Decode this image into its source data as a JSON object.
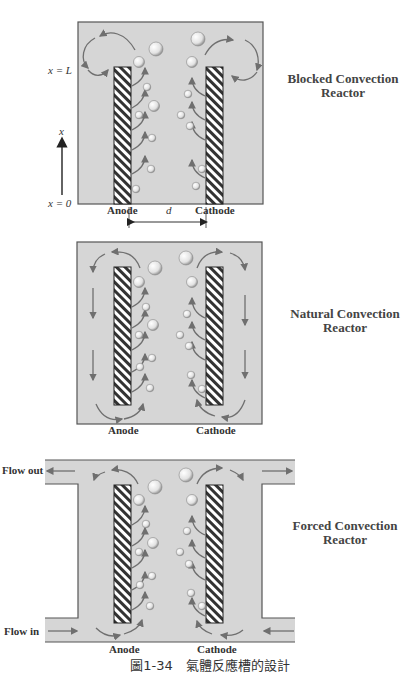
{
  "figure": {
    "caption": "圖1-34　氣體反應槽的設計",
    "colors": {
      "fill": "#d6d6d6",
      "border": "#555555",
      "arrow": "#6f6f6f",
      "bubble": "#eeeeee",
      "electrode_hatch": "#333333"
    }
  },
  "panels": [
    {
      "id": "blocked",
      "title_line1": "Blocked Convection",
      "title_line2": "Reactor",
      "anode_label": "Anode",
      "cathode_label": "Cathode",
      "gap_label": "d",
      "axis_label": "x",
      "x_top_label": "x = L",
      "x_bottom_label": "x = 0"
    },
    {
      "id": "natural",
      "title_line1": "Natural Convection",
      "title_line2": "Reactor",
      "anode_label": "Anode",
      "cathode_label": "Cathode"
    },
    {
      "id": "forced",
      "title_line1": "Forced Convection",
      "title_line2": "Reactor",
      "anode_label": "Anode",
      "cathode_label": "Cathode",
      "flow_out_label": "Flow out",
      "flow_in_label": "Flow in"
    }
  ]
}
